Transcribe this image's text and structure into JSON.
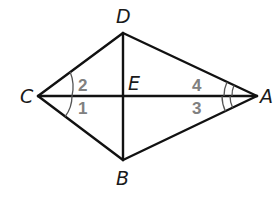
{
  "diagram": {
    "type": "kite",
    "colors": {
      "lines": "#111111",
      "vertex_labels": "#1a1a1a",
      "angle_labels": "#808080",
      "arcs": "#555555"
    },
    "vertices": {
      "A": {
        "label": "A",
        "x": 257,
        "y": 96
      },
      "B": {
        "label": "B",
        "x": 123,
        "y": 160
      },
      "C": {
        "label": "C",
        "x": 38,
        "y": 96
      },
      "D": {
        "label": "D",
        "x": 123,
        "y": 33
      },
      "E": {
        "label": "E",
        "x": 123,
        "y": 96
      }
    },
    "segments": [
      "CD",
      "DA",
      "AB",
      "BC",
      "CA",
      "DB"
    ],
    "angles": [
      {
        "label": "1",
        "vertex": "C",
        "between": [
          "CA",
          "CB"
        ],
        "arcs": 1
      },
      {
        "label": "2",
        "vertex": "C",
        "between": [
          "CD",
          "CA"
        ],
        "arcs": 1
      },
      {
        "label": "3",
        "vertex": "A",
        "between": [
          "AC",
          "AB"
        ],
        "arcs": 2
      },
      {
        "label": "4",
        "vertex": "A",
        "between": [
          "AD",
          "AC"
        ],
        "arcs": 2
      }
    ]
  }
}
